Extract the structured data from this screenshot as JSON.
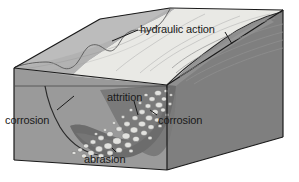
{
  "diagram": {
    "type": "block-diagram",
    "labels": {
      "hydraulic_action": "hydraulic action",
      "attrition": "attrition",
      "corrosion_left": "corrosion",
      "corrosion_right": "corrosion",
      "abrasion": "abrasion"
    },
    "colors": {
      "background": "#ffffff",
      "outline": "#1a1a1a",
      "block_front_face": "#9a9a9a",
      "block_right_face": "#808080",
      "block_top_left": "#b4b4b4",
      "valley_slope_light": "#c6c6c6",
      "valley_floor_pale": "#e8e8e4",
      "water_body": "#7d7d7d",
      "river_bed_dark": "#6e6e6e",
      "pebble_light": "#e0e0de",
      "flow_line": "#8d8d8d",
      "label_text": "#1a1a1a"
    }
  }
}
